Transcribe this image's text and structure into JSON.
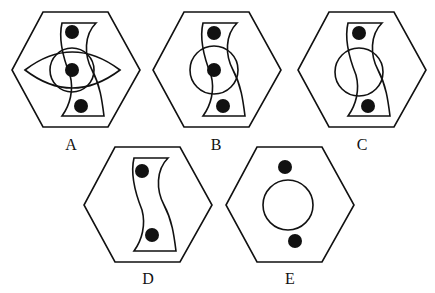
{
  "figure": {
    "type": "multiple-choice option figures",
    "stroke_color": "#111111",
    "fill_color": "#111111",
    "options": [
      {
        "label": "A",
        "elements": [
          "hexagon",
          "s-shape",
          "circle",
          "eye-lens",
          "dot-top",
          "dot-middle",
          "dot-bottom"
        ]
      },
      {
        "label": "B",
        "elements": [
          "hexagon",
          "s-shape",
          "circle",
          "dot-top",
          "dot-middle",
          "dot-bottom"
        ]
      },
      {
        "label": "C",
        "elements": [
          "hexagon",
          "s-shape",
          "circle",
          "dot-top",
          "dot-bottom"
        ]
      },
      {
        "label": "D",
        "elements": [
          "hexagon",
          "s-shape",
          "dot-top",
          "dot-bottom"
        ]
      },
      {
        "label": "E",
        "elements": [
          "hexagon",
          "circle",
          "dot-top",
          "dot-bottom"
        ]
      }
    ]
  }
}
